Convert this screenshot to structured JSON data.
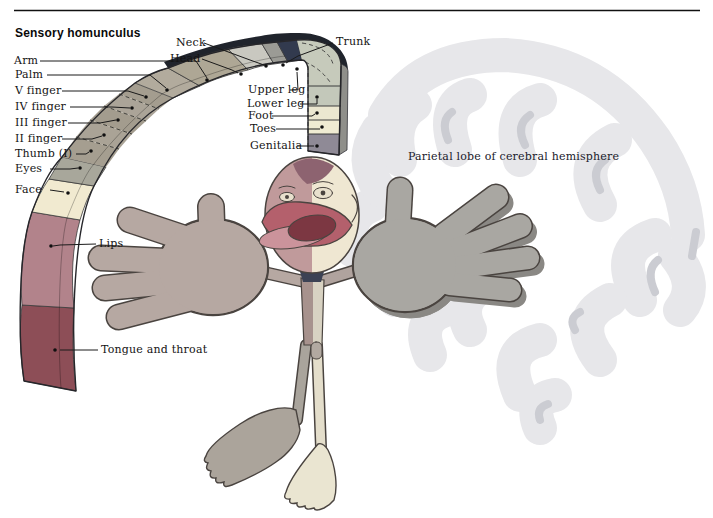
{
  "title": "Sensory homunculus",
  "labels": [
    {
      "id": "arm",
      "text": "Arm"
    },
    {
      "id": "palm",
      "text": "Palm"
    },
    {
      "id": "v-finger",
      "text": "V finger"
    },
    {
      "id": "iv-finger",
      "text": "IV finger"
    },
    {
      "id": "iii-finger",
      "text": "III finger"
    },
    {
      "id": "ii-finger",
      "text": "II finger"
    },
    {
      "id": "thumb-i",
      "text": "Thumb (I)"
    },
    {
      "id": "eyes",
      "text": "Eyes"
    },
    {
      "id": "face",
      "text": "Face"
    },
    {
      "id": "lips",
      "text": "Lips"
    },
    {
      "id": "tongue-and-throat",
      "text": "Tongue and throat"
    },
    {
      "id": "neck",
      "text": "Neck"
    },
    {
      "id": "head",
      "text": "Head"
    },
    {
      "id": "trunk",
      "text": "Trunk"
    },
    {
      "id": "upper-leg",
      "text": "Upper leg"
    },
    {
      "id": "lower-leg",
      "text": "Lower leg"
    },
    {
      "id": "foot",
      "text": "Foot"
    },
    {
      "id": "toes",
      "text": "Toes"
    },
    {
      "id": "genitalia",
      "text": "Genitalia"
    },
    {
      "id": "parietal-lobe",
      "text": "Parietal lobe of cerebral hemisphere"
    }
  ],
  "segments": [
    {
      "id": "tongue",
      "name": "Tongue and throat",
      "color": "#8d4e57"
    },
    {
      "id": "lips",
      "name": "Lips",
      "color": "#b2838b"
    },
    {
      "id": "face",
      "name": "Face",
      "color": "#f1ead0"
    },
    {
      "id": "eyes",
      "name": "Eyes",
      "color": "#a8a79b"
    },
    {
      "id": "thumb",
      "name": "Thumb (I)",
      "color": "#a59e90"
    },
    {
      "id": "ii",
      "name": "II finger",
      "color": "#aaa396"
    },
    {
      "id": "iii",
      "name": "III finger",
      "color": "#a39c8e"
    },
    {
      "id": "iv",
      "name": "IV finger",
      "color": "#aba498"
    },
    {
      "id": "v",
      "name": "V finger",
      "color": "#a49d8f"
    },
    {
      "id": "palm",
      "name": "Palm",
      "color": "#b2ab9d"
    },
    {
      "id": "arm",
      "name": "Arm",
      "color": "#aea795"
    },
    {
      "id": "headseg",
      "name": "Head",
      "color": "#c9c8c0"
    },
    {
      "id": "neckseg",
      "name": "Neck",
      "color": "#9b9b95"
    },
    {
      "id": "trunkseg",
      "name": "Trunk",
      "color": "#323a4e"
    },
    {
      "id": "upperleg",
      "name": "Upper leg",
      "color": "#c6cabb"
    },
    {
      "id": "lowerleg",
      "name": "Lower leg",
      "color": "#c3c8ba"
    },
    {
      "id": "footseg",
      "name": "Foot",
      "color": "#ebe7d0"
    },
    {
      "id": "toesseg",
      "name": "Toes",
      "color": "#efebd2"
    },
    {
      "id": "genitaliaseg",
      "name": "Genitalia",
      "color": "#8f8a96"
    }
  ],
  "colors": {
    "rule": "#111111",
    "leader_line": "#1a1a1a",
    "band_outline": "#26262a",
    "band_bevel_dark": "#20242c",
    "column_bevel": "#8f8f8a",
    "brain": "#e6e6e9",
    "brain_accent": "#c9cad0",
    "figure_left_hand": "#b6a8a2",
    "figure_right_hand": "#a9a7a2",
    "figure_outline": "#4a4440",
    "head_left": "#c09a9b",
    "head_right": "#efe7d2",
    "head_crown": "#8d6370",
    "lip_outer": "#b4606c",
    "lip_lower": "#cb939b",
    "mouth_opening": "#7c3742",
    "collar": "#3c4254",
    "left_foot": "#aba49b",
    "right_foot": "#eae5d1"
  }
}
